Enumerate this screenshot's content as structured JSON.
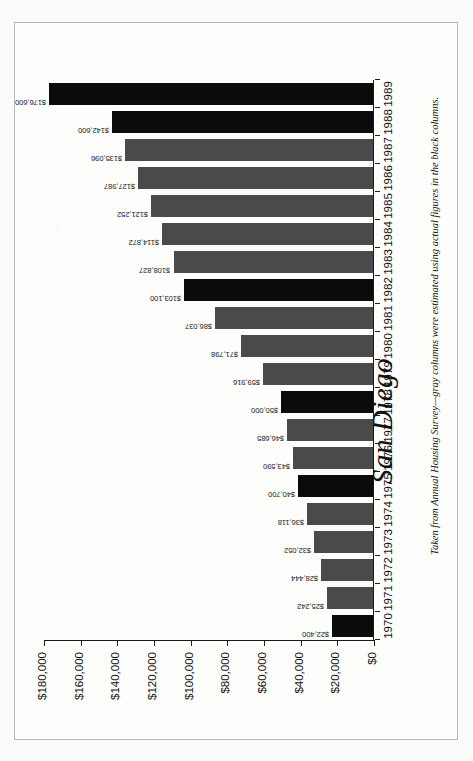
{
  "figure": {
    "title": "San Diego",
    "footnote": "Taken from Annual Housing Survey—gray columns were estimated using actual figures in the black columns.",
    "colors": {
      "actual_column": "#0b0b0b",
      "estimated_column": "#4a4a4a",
      "axis": "#1a1a1a",
      "page_background": "#fbfbfa"
    }
  },
  "chart_data": {
    "type": "bar",
    "title": "San Diego",
    "xlabel": "",
    "ylabel": "",
    "orientation": "vertical",
    "grid": false,
    "legend_position": "none",
    "ylim": [
      0,
      180000
    ],
    "ytick_labels": [
      "$180,000",
      "$160,000",
      "$140,000",
      "$120,000",
      "$100,000",
      "$80,000",
      "$60,000",
      "$40,000",
      "$20,000",
      "$0"
    ],
    "ytick_values": [
      180000,
      160000,
      140000,
      120000,
      100000,
      80000,
      60000,
      40000,
      20000,
      0
    ],
    "categories": [
      "1970",
      "1971",
      "1972",
      "1973",
      "1974",
      "1975",
      "1976",
      "1977",
      "1978",
      "1979",
      "1980",
      "1981",
      "1982",
      "1983",
      "1984",
      "1985",
      "1986",
      "1987",
      "1988",
      "1989"
    ],
    "values": [
      22400,
      25242,
      28444,
      32052,
      36118,
      40700,
      43590,
      46685,
      50000,
      59916,
      71798,
      86037,
      103100,
      108827,
      114872,
      121252,
      127987,
      135096,
      142600,
      176600
    ],
    "value_labels": [
      "$22,400",
      "$25,242",
      "$28,444",
      "$32,052",
      "$36,118",
      "$40,700",
      "$43,590",
      "$46,685",
      "$50,000",
      "$59,916",
      "$71,798",
      "$86,037",
      "$103,100",
      "$108,827",
      "$114,872",
      "$121,252",
      "$127,987",
      "$135,096",
      "$142,600",
      "$176,600"
    ],
    "bar_styles": [
      "black",
      "gray",
      "gray",
      "gray",
      "gray",
      "black",
      "gray",
      "gray",
      "black",
      "gray",
      "gray",
      "gray",
      "black",
      "gray",
      "gray",
      "gray",
      "gray",
      "gray",
      "black",
      "black"
    ],
    "annotation": "Taken from Annual Housing Survey—gray columns were estimated using actual figures in the black columns."
  }
}
